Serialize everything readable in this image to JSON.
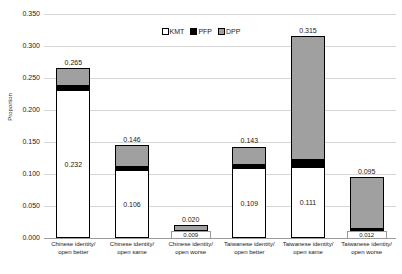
{
  "chart_data": {
    "type": "bar",
    "subtype": "stacked-column",
    "title": "",
    "xlabel": "",
    "ylabel": "Proportion",
    "ylim": [
      0.0,
      0.35
    ],
    "ytick_step": 0.05,
    "ytick_labels": [
      "0.350",
      "0.300",
      "0.250",
      "0.200",
      "0.150",
      "0.100",
      "0.050",
      "0.000"
    ],
    "ytick_values": [
      0.35,
      0.3,
      0.25,
      0.2,
      0.15,
      0.1,
      0.05,
      0.0
    ],
    "grid": true,
    "legend_position": "top-center",
    "categories": [
      "Chinese identity/ open better",
      "Chinese identity/ open same",
      "Chinese identity/ open worse",
      "Taiwanese identity/ open better",
      "Taiwanese identity/ open same",
      "Taiwanese identity/ open worse"
    ],
    "category_lines": [
      [
        "Chinese identity/",
        "open better"
      ],
      [
        "Chinese identity/",
        "open same"
      ],
      [
        "Chinese identity/",
        "open worse"
      ],
      [
        "Taiwanese identity/",
        "open better"
      ],
      [
        "Taiwanese identity/",
        "open same"
      ],
      [
        "Taiwanese identity/",
        "open worse"
      ]
    ],
    "series": [
      {
        "name": "KMT",
        "color": "#ffffff",
        "values": [
          0.232,
          0.106,
          0.009,
          0.109,
          0.111,
          0.012
        ]
      },
      {
        "name": "PFP",
        "color": "#000000",
        "values": [
          0.005,
          0.005,
          0.002,
          0.005,
          0.011,
          0.002
        ]
      },
      {
        "name": "DPP",
        "color": "#a0a0a0",
        "values": [
          0.028,
          0.035,
          0.009,
          0.029,
          0.193,
          0.081
        ]
      }
    ],
    "totals": [
      0.265,
      0.146,
      0.02,
      0.143,
      0.315,
      0.095
    ],
    "total_labels": [
      "0.265",
      "0.146",
      "0.020",
      "0.143",
      "0.315",
      "0.095"
    ],
    "kmt_labels": [
      "0.232",
      "0.106",
      "0.009",
      "0.109",
      "0.111",
      "0.012"
    ]
  },
  "legend": {
    "items": [
      {
        "label": "KMT"
      },
      {
        "label": "PFP"
      },
      {
        "label": "DPP"
      }
    ]
  },
  "axes": {
    "y_title": "Proportion"
  }
}
